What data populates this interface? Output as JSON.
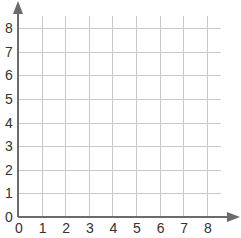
{
  "chart_data": {
    "type": "scatter",
    "title": "",
    "xlabel": "",
    "ylabel": "",
    "x_ticks": [
      "0",
      "1",
      "2",
      "3",
      "4",
      "5",
      "6",
      "7",
      "8"
    ],
    "y_ticks": [
      "0",
      "1",
      "2",
      "3",
      "4",
      "5",
      "6",
      "7",
      "8"
    ],
    "xlim": [
      0,
      8
    ],
    "ylim": [
      0,
      8
    ],
    "grid": true,
    "series": [],
    "points": [],
    "axis_arrows": true,
    "legend": null
  },
  "colors": {
    "axis": "#6b6b6b",
    "grid": "#c8c8c8",
    "label": "#333333",
    "background": "#ffffff"
  }
}
